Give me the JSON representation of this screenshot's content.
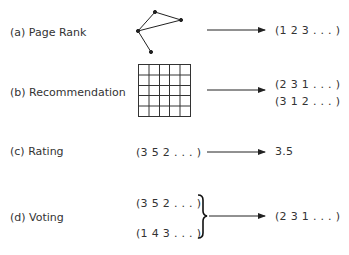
{
  "rows": [
    {
      "id": "a",
      "label": "(a)  Page Rank",
      "input_type": "graph",
      "outputs": [
        "(1  2  3 . . . )"
      ]
    },
    {
      "id": "b",
      "label": "(b)  Recommendation",
      "input_type": "matrix-grid",
      "outputs": [
        "(2  3  1 . . . )",
        "(3  1  2 . . . )"
      ]
    },
    {
      "id": "c",
      "label": "(c)  Rating",
      "input_type": "sequence",
      "inputs": [
        "(3  5  2 . . . )"
      ],
      "outputs": [
        "3.5"
      ]
    },
    {
      "id": "d",
      "label": "(d)  Voting",
      "input_type": "sequences",
      "inputs": [
        "(3  5  2 . . . )",
        "(1  4  3 . . . )"
      ],
      "outputs": [
        "(2  3  1 . . . )"
      ]
    }
  ],
  "colors": {
    "ink": "#333333",
    "background": "#ffffff"
  }
}
